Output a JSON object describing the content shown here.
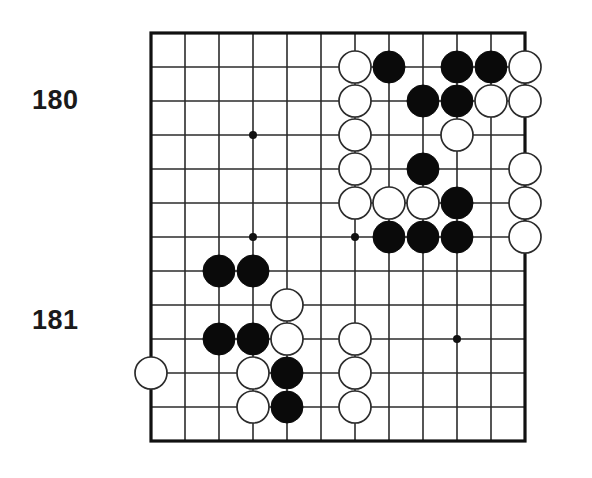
{
  "figure": {
    "type": "go-board-diagram",
    "caption_labels": [
      {
        "id": "label-180",
        "text": "180"
      },
      {
        "id": "label-181",
        "text": "181"
      }
    ]
  },
  "board": {
    "columns": 12,
    "rows": 13,
    "origin_x": 151,
    "origin_y": 33,
    "cell": 34,
    "stone_radius": 16,
    "line_color": "#2b2b2b",
    "border_color": "#111111",
    "black_color": "#0a0a0a",
    "white_color": "#ffffff",
    "background_color": "#ffffff",
    "star_points": [
      {
        "col": 3,
        "row": 3
      },
      {
        "col": 3,
        "row": 6
      },
      {
        "col": 6,
        "row": 6
      },
      {
        "col": 9,
        "row": 9
      }
    ],
    "stones": [
      {
        "col": 6,
        "row": 1,
        "color": "white"
      },
      {
        "col": 7,
        "row": 1,
        "color": "black"
      },
      {
        "col": 9,
        "row": 1,
        "color": "black"
      },
      {
        "col": 10,
        "row": 1,
        "color": "black"
      },
      {
        "col": 11,
        "row": 1,
        "color": "white"
      },
      {
        "col": 6,
        "row": 2,
        "color": "white"
      },
      {
        "col": 8,
        "row": 2,
        "color": "black"
      },
      {
        "col": 9,
        "row": 2,
        "color": "black"
      },
      {
        "col": 10,
        "row": 2,
        "color": "white"
      },
      {
        "col": 11,
        "row": 2,
        "color": "white"
      },
      {
        "col": 6,
        "row": 3,
        "color": "white"
      },
      {
        "col": 9,
        "row": 3,
        "color": "white"
      },
      {
        "col": 6,
        "row": 4,
        "color": "white"
      },
      {
        "col": 8,
        "row": 4,
        "color": "black"
      },
      {
        "col": 11,
        "row": 4,
        "color": "white"
      },
      {
        "col": 6,
        "row": 5,
        "color": "white"
      },
      {
        "col": 7,
        "row": 5,
        "color": "white"
      },
      {
        "col": 8,
        "row": 5,
        "color": "white"
      },
      {
        "col": 9,
        "row": 5,
        "color": "black"
      },
      {
        "col": 11,
        "row": 5,
        "color": "white"
      },
      {
        "col": 7,
        "row": 6,
        "color": "black"
      },
      {
        "col": 8,
        "row": 6,
        "color": "black"
      },
      {
        "col": 9,
        "row": 6,
        "color": "black"
      },
      {
        "col": 11,
        "row": 6,
        "color": "white"
      },
      {
        "col": 2,
        "row": 7,
        "color": "black"
      },
      {
        "col": 3,
        "row": 7,
        "color": "black"
      },
      {
        "col": 4,
        "row": 8,
        "color": "white"
      },
      {
        "col": 2,
        "row": 9,
        "color": "black"
      },
      {
        "col": 3,
        "row": 9,
        "color": "black"
      },
      {
        "col": 4,
        "row": 9,
        "color": "white"
      },
      {
        "col": 6,
        "row": 9,
        "color": "white"
      },
      {
        "col": 0,
        "row": 10,
        "color": "white"
      },
      {
        "col": 3,
        "row": 10,
        "color": "white"
      },
      {
        "col": 4,
        "row": 10,
        "color": "black"
      },
      {
        "col": 6,
        "row": 10,
        "color": "white"
      },
      {
        "col": 3,
        "row": 11,
        "color": "white"
      },
      {
        "col": 4,
        "row": 11,
        "color": "black"
      },
      {
        "col": 6,
        "row": 11,
        "color": "white"
      }
    ]
  }
}
